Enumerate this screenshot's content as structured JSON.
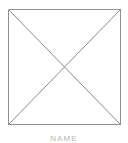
{
  "figure": {
    "caption": "NAME",
    "background_color": "#ffffff",
    "line_color": "#8a8a8a",
    "diagonal_color": "#7a7a7a",
    "caption_color": "#b9b9b9",
    "line_width": 1,
    "canvas": {
      "width": 128,
      "height": 143
    },
    "square": {
      "left": 8,
      "top": 9,
      "right": 120,
      "bottom": 124,
      "width": 112,
      "height": 115
    },
    "center_point": {
      "x": 64,
      "y": 66.5
    },
    "shapes": [
      {
        "name": "square-border",
        "type": "rect",
        "points": "8,9 120,9 120,124 8,124"
      },
      {
        "name": "diagonal-top-left-to-bottom-right",
        "type": "line",
        "points": "8,9 120,124"
      },
      {
        "name": "diagonal-top-right-to-bottom-left",
        "type": "line",
        "points": "120,9 8,124"
      }
    ]
  }
}
